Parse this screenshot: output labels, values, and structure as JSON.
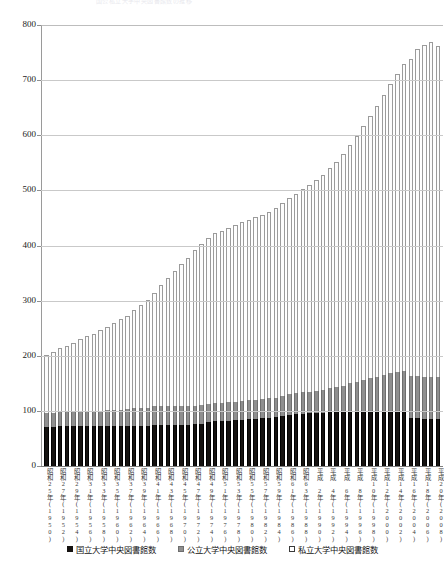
{
  "chart_data": {
    "type": "bar",
    "stacked": true,
    "title": "国公私立大学中央図書館数の推移",
    "xlabel": "",
    "ylabel": "",
    "ylim": [
      0,
      800
    ],
    "ytick_step": 100,
    "yticks": [
      "0",
      "100",
      "200",
      "300",
      "400",
      "500",
      "600",
      "700",
      "800"
    ],
    "grid": true,
    "legend_position": "bottom",
    "legend": [
      "国立大学中央図書館数",
      "公立大学中央図書館数",
      "私立大学中央図書館数"
    ],
    "colors": {
      "national": "#151210",
      "public": "#8f8f8f",
      "private": "#ffffff"
    },
    "categories": [
      "昭和25年(1950)",
      "昭和26年(1951)",
      "昭和27年(1952)",
      "昭和28年(1953)",
      "昭和29年(1954)",
      "昭和30年(1955)",
      "昭和31年(1956)",
      "昭和32年(1957)",
      "昭和33年(1958)",
      "昭和34年(1959)",
      "昭和35年(1960)",
      "昭和36年(1961)",
      "昭和37年(1962)",
      "昭和38年(1963)",
      "昭和39年(1964)",
      "昭和40年(1965)",
      "昭和41年(1966)",
      "昭和42年(1967)",
      "昭和43年(1968)",
      "昭和44年(1969)",
      "昭和45年(1970)",
      "昭和46年(1971)",
      "昭和47年(1972)",
      "昭和48年(1973)",
      "昭和49年(1974)",
      "昭和50年(1975)",
      "昭和51年(1976)",
      "昭和52年(1977)",
      "昭和53年(1978)",
      "昭和54年(1979)",
      "昭和55年(1980)",
      "昭和56年(1981)",
      "昭和57年(1982)",
      "昭和58年(1983)",
      "昭和59年(1984)",
      "昭和60年(1985)",
      "昭和61年(1986)",
      "昭和62年(1987)",
      "昭和63年(1988)",
      "平成元年(1989)",
      "平成 2年(1990)",
      "平成 3年(1991)",
      "平成 4年(1992)",
      "平成 5年(1993)",
      "平成 6年(1994)",
      "平成 7年(1995)",
      "平成 8年(1996)",
      "平成 9年(1997)",
      "平成10年(1998)",
      "平成11年(1999)",
      "平成12年(2000)",
      "平成13年(2001)",
      "平成14年(2002)",
      "平成15年(2003)",
      "平成16年(2004)",
      "平成17年(2005)",
      "平成18年(2006)",
      "平成19年(2007)",
      "平成20年(2008)"
    ],
    "visible_tick_labels": [
      "昭和25年(1950)",
      "昭和27年(1952)",
      "昭和29年(1954)",
      "昭和31年(1956)",
      "昭和33年(1958)",
      "昭和35年(1960)",
      "昭和37年(1962)",
      "昭和39年(1964)",
      "昭和41年(1966)",
      "昭和43年(1968)",
      "昭和45年(1970)",
      "昭和47年(1972)",
      "昭和49年(1974)",
      "昭和51年(1976)",
      "昭和53年(1978)",
      "昭和55年(1980)",
      "昭和57年(1982)",
      "昭和59年(1984)",
      "昭和61年(1986)",
      "昭和63年(1988)",
      "平成 2年(1990)",
      "平成 4年(1992)",
      "平成 6年(1994)",
      "平成 8年(1996)",
      "平成10年(1998)",
      "平成12年(2000)",
      "平成14年(2002)",
      "平成16年(2004)",
      "平成18年(2006)",
      "平成20年(2008)"
    ],
    "series": [
      {
        "name": "国立大学中央図書館数",
        "key": "national",
        "values": [
          70,
          71,
          72,
          72,
          72,
          72,
          72,
          72,
          72,
          72,
          72,
          72,
          72,
          73,
          73,
          73,
          74,
          75,
          75,
          75,
          75,
          75,
          76,
          77,
          79,
          81,
          81,
          82,
          83,
          84,
          85,
          86,
          87,
          88,
          89,
          91,
          93,
          94,
          95,
          96,
          96,
          97,
          98,
          98,
          98,
          98,
          98,
          99,
          99,
          99,
          99,
          99,
          99,
          99,
          87,
          87,
          86,
          86,
          86
        ]
      },
      {
        "name": "公立大学中央図書館数",
        "key": "public",
        "values": [
          26,
          26,
          26,
          26,
          27,
          27,
          27,
          28,
          28,
          29,
          29,
          30,
          31,
          32,
          33,
          33,
          34,
          34,
          34,
          34,
          33,
          33,
          33,
          33,
          34,
          34,
          34,
          34,
          34,
          34,
          34,
          34,
          34,
          35,
          35,
          36,
          37,
          38,
          39,
          39,
          40,
          41,
          44,
          46,
          48,
          52,
          55,
          57,
          60,
          62,
          66,
          70,
          72,
          74,
          76,
          77,
          76,
          76,
          76
        ]
      },
      {
        "name": "私立大学中央図書館数",
        "key": "private",
        "values": [
          106,
          110,
          116,
          120,
          124,
          132,
          136,
          140,
          146,
          152,
          158,
          164,
          170,
          178,
          186,
          196,
          206,
          220,
          232,
          244,
          258,
          270,
          282,
          292,
          300,
          308,
          312,
          316,
          320,
          324,
          328,
          332,
          334,
          338,
          344,
          350,
          356,
          362,
          368,
          374,
          382,
          390,
          398,
          408,
          420,
          432,
          446,
          460,
          476,
          492,
          508,
          524,
          540,
          556,
          576,
          592,
          602,
          608,
          600
        ]
      }
    ]
  }
}
